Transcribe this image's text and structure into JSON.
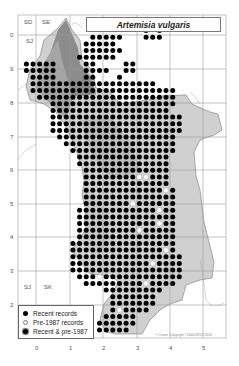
{
  "map": {
    "title": "Artemisia vulgaris",
    "region_letters": {
      "top_left_1": "SD",
      "top_left_2": "SE",
      "top_left_3": "SJ",
      "bottom_left_1": "SJ",
      "bottom_left_2": "SK"
    },
    "y_axis_labels": [
      "0",
      "9",
      "8",
      "7",
      "6",
      "5",
      "4",
      "3",
      "2"
    ],
    "x_axis_labels": [
      "0",
      "1",
      "2",
      "3",
      "4",
      "5"
    ],
    "legend": {
      "items": [
        {
          "symbol": "recent",
          "label": "Recent records"
        },
        {
          "symbol": "pre",
          "label": "Pre-1987 records"
        },
        {
          "symbol": "both",
          "label": "Recent & pre-1987"
        }
      ]
    },
    "copyright": "© Crown Copyright / 100024915 2014",
    "colors": {
      "recent_dot": "#000000",
      "pre_dot": "#ffffff",
      "relief_dark": "#8c8c8c",
      "relief_mid": "#b4b4b4",
      "relief_light": "#d8d8d8",
      "grid": "#9a9a9a"
    }
  }
}
